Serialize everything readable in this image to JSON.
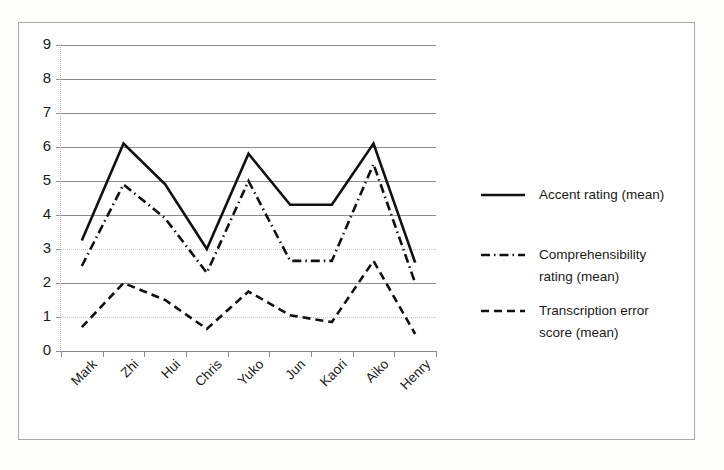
{
  "chart_data": {
    "type": "line",
    "title": "",
    "subtitle": "",
    "xlabel": "",
    "ylabel": "",
    "categories": [
      "Mark",
      "Zhi",
      "Hui",
      "Chris",
      "Yuko",
      "Jun",
      "Kaori",
      "Aiko",
      "Henry"
    ],
    "ylim": [
      0,
      9
    ],
    "yticks": [
      0,
      1,
      2,
      3,
      4,
      5,
      6,
      7,
      8,
      9
    ],
    "ytick_labels": [
      "0",
      "1",
      "2",
      "3",
      "4",
      "5",
      "6",
      "7",
      "8",
      "9"
    ],
    "grid": true,
    "grid_axis": "y",
    "legend_position": "right",
    "series": [
      {
        "name": "Accent rating (mean)",
        "style": "solid",
        "color": "#111111",
        "values": [
          3.25,
          6.1,
          4.9,
          3.0,
          5.8,
          4.3,
          4.3,
          6.1,
          2.6
        ]
      },
      {
        "name": "Comprehensibility rating (mean)",
        "style": "dash-dot",
        "color": "#111111",
        "values": [
          2.5,
          4.9,
          3.9,
          2.3,
          5.0,
          2.65,
          2.65,
          5.5,
          2.0
        ]
      },
      {
        "name": "Transcription error score (mean)",
        "style": "dashed",
        "color": "#111111",
        "values": [
          0.7,
          2.0,
          1.5,
          0.65,
          1.75,
          1.05,
          0.85,
          2.65,
          0.5
        ]
      }
    ]
  },
  "legend": {
    "entries": [
      {
        "label_line1": "Accent rating (mean)",
        "label_line2": ""
      },
      {
        "label_line1": "Comprehensibility",
        "label_line2": "rating (mean)"
      },
      {
        "label_line1": "Transcription error",
        "label_line2": "score (mean)"
      }
    ]
  }
}
